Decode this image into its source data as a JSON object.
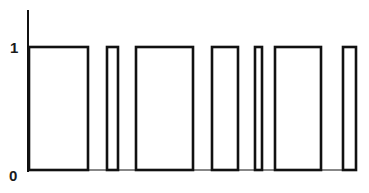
{
  "chart_data": {
    "type": "bar",
    "title": "",
    "xlabel": "",
    "ylabel": "",
    "ylim": [
      0,
      1
    ],
    "yticks": [
      {
        "label": "0",
        "value": 0
      },
      {
        "label": "1",
        "value": 1
      }
    ],
    "grid": false,
    "legend": null,
    "pulses": [
      {
        "index": 1,
        "x_start": 28,
        "x_end": 88,
        "value": 1
      },
      {
        "index": 2,
        "x_start": 106,
        "x_end": 118,
        "value": 1
      },
      {
        "index": 3,
        "x_start": 135,
        "x_end": 193,
        "value": 1
      },
      {
        "index": 4,
        "x_start": 211,
        "x_end": 238,
        "value": 1
      },
      {
        "index": 5,
        "x_start": 254,
        "x_end": 262,
        "value": 1
      },
      {
        "index": 6,
        "x_start": 274,
        "x_end": 321,
        "value": 1
      },
      {
        "index": 7,
        "x_start": 342,
        "x_end": 356,
        "value": 1
      }
    ],
    "values": [
      1,
      1,
      1,
      1,
      1,
      1,
      1
    ]
  },
  "axes": {
    "y_tick_high": "1",
    "y_tick_low": "0"
  },
  "style": {
    "line_color": "#111111",
    "background": "#ffffff"
  }
}
